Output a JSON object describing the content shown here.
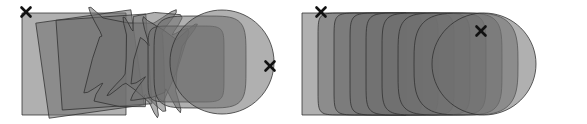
{
  "figure": {
    "width": 587,
    "height": 124,
    "background": "#ffffff",
    "type": "shape-interpolation-diagram"
  },
  "colors": {
    "shape_fill": "#6f6f6f",
    "shape_fill_rgba": "rgba(110,110,110,0.55)",
    "shape_stroke": "#2e2e2e",
    "single_layer_gray": "#8a8a8a",
    "light_gray": "#b0b0b0",
    "dark_overlap_gray": "#3d3d3d",
    "marker_color": "#111111",
    "background": "#ffffff"
  },
  "panels": [
    {
      "id": "left",
      "name": "unaligned-interpolation",
      "x": 0,
      "y": 0,
      "width": 294,
      "height": 124,
      "markers": [
        {
          "label": "x",
          "name": "correspondence-marker-start",
          "cx": 26,
          "cy": 12,
          "size": 9
        },
        {
          "label": "x",
          "name": "correspondence-marker-end",
          "cx": 270,
          "cy": 66,
          "size": 9
        }
      ],
      "shape_count": 9
    },
    {
      "id": "right",
      "name": "translated-interpolation",
      "x": 294,
      "y": 0,
      "width": 293,
      "height": 124,
      "markers": [
        {
          "label": "x",
          "name": "correspondence-marker-start",
          "cx": 27,
          "cy": 12,
          "size": 9
        },
        {
          "label": "x",
          "name": "correspondence-marker-end",
          "cx": 187,
          "cy": 31,
          "size": 9
        }
      ],
      "shape_count": 9
    }
  ],
  "chart_data": {
    "type": "diagram",
    "title": "",
    "xlabel": "",
    "ylabel": "",
    "series": [
      {
        "name": "left-panel-unaligned-morph",
        "shapes": [
          {
            "index": 0,
            "t": 0.0,
            "kind": "square",
            "cx": 74,
            "cy": 64,
            "rx": 52,
            "ry": 51,
            "corner": 0.0,
            "rotation": 0,
            "opacity": 0.55
          },
          {
            "index": 1,
            "t": 0.12,
            "kind": "square",
            "cx": 90,
            "cy": 64,
            "rx": 48,
            "ry": 48,
            "corner": 0.03,
            "rotation": -8,
            "opacity": 0.55
          },
          {
            "index": 2,
            "t": 0.25,
            "kind": "square",
            "cx": 104,
            "cy": 62,
            "rx": 45,
            "ry": 45,
            "corner": 0.05,
            "rotation": -4,
            "opacity": 0.55
          },
          {
            "index": 3,
            "t": 0.38,
            "kind": "folded",
            "cx": 124,
            "cy": 62,
            "rx": 36,
            "ry": 42,
            "corner": 0.1,
            "rotation": 6,
            "opacity": 0.55
          },
          {
            "index": 4,
            "t": 0.5,
            "kind": "folded",
            "cx": 142,
            "cy": 63,
            "rx": 26,
            "ry": 40,
            "corner": 0.16,
            "rotation": 14,
            "opacity": 0.55
          },
          {
            "index": 5,
            "t": 0.62,
            "kind": "folded",
            "cx": 158,
            "cy": 64,
            "rx": 22,
            "ry": 34,
            "corner": 0.24,
            "rotation": 10,
            "opacity": 0.55
          },
          {
            "index": 6,
            "t": 0.75,
            "kind": "rounded",
            "cx": 186,
            "cy": 64,
            "rx": 38,
            "ry": 38,
            "corner": 0.45,
            "rotation": 0,
            "opacity": 0.55
          },
          {
            "index": 7,
            "t": 0.88,
            "kind": "rounded",
            "cx": 200,
            "cy": 62,
            "rx": 46,
            "ry": 46,
            "corner": 0.72,
            "rotation": 0,
            "opacity": 0.55
          },
          {
            "index": 8,
            "t": 1.0,
            "kind": "circle",
            "cx": 222,
            "cy": 62,
            "rx": 52,
            "ry": 52,
            "corner": 1.0,
            "rotation": 0,
            "opacity": 0.55
          }
        ]
      },
      {
        "name": "right-panel-translated-morph",
        "shapes": [
          {
            "index": 0,
            "t": 0.0,
            "kind": "square",
            "cx": 60,
            "cy": 64,
            "rx": 52,
            "ry": 51,
            "corner": 0.0,
            "opacity": 0.55
          },
          {
            "index": 1,
            "t": 0.12,
            "kind": "rounded",
            "cx": 76,
            "cy": 64,
            "rx": 52,
            "ry": 51,
            "corner": 0.12,
            "opacity": 0.55
          },
          {
            "index": 2,
            "t": 0.25,
            "kind": "rounded",
            "cx": 92,
            "cy": 64,
            "rx": 52,
            "ry": 51,
            "corner": 0.22,
            "opacity": 0.55
          },
          {
            "index": 3,
            "t": 0.38,
            "kind": "rounded",
            "cx": 108,
            "cy": 64,
            "rx": 52,
            "ry": 51,
            "corner": 0.34,
            "opacity": 0.55
          },
          {
            "index": 4,
            "t": 0.5,
            "kind": "rounded",
            "cx": 124,
            "cy": 64,
            "rx": 52,
            "ry": 51,
            "corner": 0.46,
            "opacity": 0.55
          },
          {
            "index": 5,
            "t": 0.62,
            "kind": "rounded",
            "cx": 140,
            "cy": 64,
            "rx": 52,
            "ry": 51,
            "corner": 0.58,
            "opacity": 0.55
          },
          {
            "index": 6,
            "t": 0.75,
            "kind": "rounded",
            "cx": 156,
            "cy": 64,
            "rx": 52,
            "ry": 51,
            "corner": 0.72,
            "opacity": 0.55
          },
          {
            "index": 7,
            "t": 0.88,
            "kind": "rounded",
            "cx": 172,
            "cy": 64,
            "rx": 52,
            "ry": 51,
            "corner": 0.86,
            "opacity": 0.55
          },
          {
            "index": 8,
            "t": 1.0,
            "kind": "circle",
            "cx": 190,
            "cy": 64,
            "rx": 52,
            "ry": 51,
            "corner": 1.0,
            "opacity": 0.55
          }
        ]
      }
    ],
    "legend": [],
    "annotations": [
      {
        "text": "x",
        "panel": "left",
        "x": 26,
        "y": 12
      },
      {
        "text": "x",
        "panel": "left",
        "x": 270,
        "y": 66
      },
      {
        "text": "x",
        "panel": "right",
        "x": 27,
        "y": 12
      },
      {
        "text": "x",
        "panel": "right",
        "x": 187,
        "y": 31
      }
    ],
    "grid": false,
    "axis_visible": false
  }
}
